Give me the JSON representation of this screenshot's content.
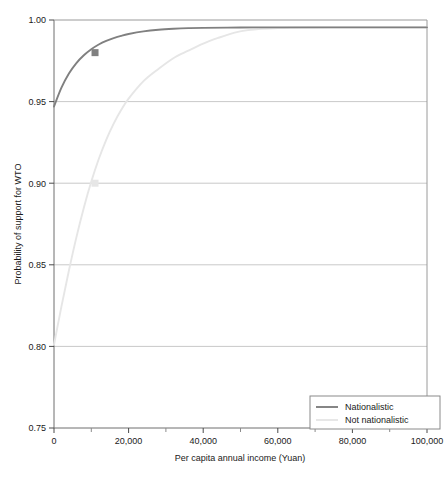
{
  "chart_data": {
    "type": "line",
    "title": "",
    "xlabel": "Per capita annual income (Yuan)",
    "ylabel": "Probability of support for WTO",
    "xlim": [
      0,
      100000
    ],
    "ylim": [
      0.75,
      1.0
    ],
    "xticks": [
      0,
      20000,
      40000,
      60000,
      80000,
      100000
    ],
    "xtick_labels": [
      "0",
      "20,000",
      "40,000",
      "60,000",
      "80,000",
      "100,000"
    ],
    "xminor_ticks": [
      10000,
      30000,
      50000,
      70000,
      90000
    ],
    "yticks": [
      0.75,
      0.8,
      0.85,
      0.9,
      0.95,
      1.0
    ],
    "ytick_labels": [
      "0.75",
      "0.80",
      "0.85",
      "0.90",
      "0.95",
      "1.00"
    ],
    "grid": "horizontal",
    "legend_position": "bottom-right",
    "series": [
      {
        "name": "Nationalistic",
        "color": "#808080",
        "marker": {
          "x": 11000,
          "y": 0.98,
          "shape": "square"
        },
        "x": [
          0,
          2000,
          4000,
          6000,
          8000,
          10000,
          12000,
          14000,
          16000,
          18000,
          20000,
          24000,
          28000,
          32000,
          36000,
          40000,
          50000,
          60000,
          70000,
          80000,
          90000,
          100000
        ],
        "y": [
          0.947,
          0.9585,
          0.9672,
          0.9736,
          0.9784,
          0.9821,
          0.985,
          0.9872,
          0.9889,
          0.9903,
          0.9914,
          0.993,
          0.994,
          0.9946,
          0.995,
          0.9952,
          0.9954,
          0.9955,
          0.9955,
          0.9955,
          0.9955,
          0.9955
        ]
      },
      {
        "name": "Not nationalistic",
        "color": "#e6e6e6",
        "marker": {
          "x": 11000,
          "y": 0.9,
          "shape": "square"
        },
        "x": [
          0,
          2000,
          4000,
          6000,
          8000,
          10000,
          12000,
          14000,
          16000,
          18000,
          20000,
          24000,
          28000,
          32000,
          36000,
          40000,
          44000,
          48000,
          52000,
          60000,
          70000,
          80000,
          90000,
          100000
        ],
        "y": [
          0.801,
          0.8245,
          0.8465,
          0.8668,
          0.885,
          0.901,
          0.9148,
          0.9266,
          0.9365,
          0.9448,
          0.9518,
          0.9625,
          0.97,
          0.9766,
          0.9812,
          0.9855,
          0.989,
          0.992,
          0.9938,
          0.995,
          0.9954,
          0.9955,
          0.9955,
          0.9955
        ]
      }
    ]
  },
  "legend": {
    "items": [
      {
        "label": "Nationalistic",
        "color": "#808080"
      },
      {
        "label": "Not nationalistic",
        "color": "#e6e6e6"
      }
    ]
  },
  "axes": {
    "x_title": "Per capita annual income (Yuan)",
    "y_title": "Probability of support for WTO"
  }
}
